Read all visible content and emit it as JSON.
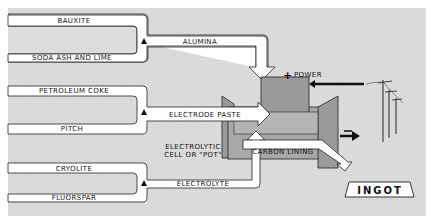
{
  "diagram": {
    "inputs": [
      {
        "group": "alumina",
        "materials": [
          "BAUXITE",
          "SODA ASH AND LIME"
        ],
        "product": "ALUMINA"
      },
      {
        "group": "electrode",
        "materials": [
          "PETROLEUM COKE",
          "PITCH"
        ],
        "product": "ELECTRODE PASTE"
      },
      {
        "group": "electrolyte",
        "materials": [
          "CRYOLITE",
          "FLUORSPAR"
        ],
        "product": "ELECTROLYTE"
      }
    ],
    "cell_label_line1": "ELECTROLYTIC",
    "cell_label_line2": "CELL OR \"POT\"",
    "lining_label": "CARBON LINING",
    "power_sign": "+",
    "power_label": "POWER",
    "negative_sign": "−",
    "output": "INGOT",
    "colors": {
      "background": "#dcdcdc",
      "channel": "#ffffff",
      "cell_dark": "#9a9a9a",
      "cell_mid": "#b5b5b5",
      "outline": "#222222"
    }
  }
}
